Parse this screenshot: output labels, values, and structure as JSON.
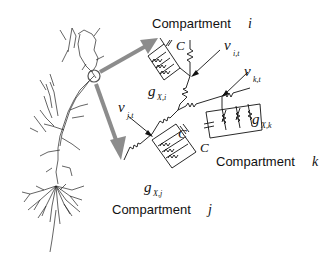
{
  "figure": {
    "compartments": [
      {
        "id": "i",
        "label": "Compartment",
        "index": "i",
        "voltage": "v",
        "voltage_sub": "i,t",
        "conductance": "g",
        "conductance_sub": "X,i",
        "capacitance": "C"
      },
      {
        "id": "j",
        "label": "Compartment",
        "index": "j",
        "voltage": "v",
        "voltage_sub": "j,t",
        "conductance": "g",
        "conductance_sub": "X,j",
        "capacitance": "C"
      },
      {
        "id": "k",
        "label": "Compartment",
        "index": "k",
        "voltage": "v",
        "voltage_sub": "k,t",
        "conductance": "g",
        "conductance_sub": "X,k",
        "capacitance": "C"
      }
    ],
    "colors": {
      "arrow": "#8c8c8c",
      "ink": "#111111",
      "background": "#ffffff"
    }
  }
}
